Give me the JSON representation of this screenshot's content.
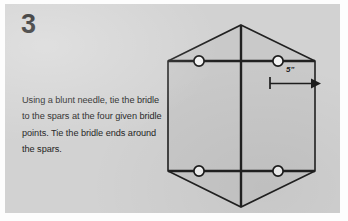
{
  "step": {
    "number": "3",
    "instruction_lines": [
      "Using a blunt needle, tie the bridle",
      "to the spars at the four given bridle",
      "points. Tie the bridle ends around",
      "the spars."
    ]
  },
  "diagram": {
    "shape": "hexagon",
    "dimension": {
      "label": "5\"",
      "marker": "tick-and-arrow",
      "measures": "distance-from-vertical-spar-to-right-edge"
    },
    "bridle_points": [
      {
        "name": "upper-left-bridle-point"
      },
      {
        "name": "upper-right-bridle-point"
      },
      {
        "name": "lower-left-bridle-point"
      },
      {
        "name": "lower-right-bridle-point"
      }
    ],
    "spars": [
      {
        "name": "vertical-spar"
      },
      {
        "name": "upper-horizontal-spar"
      },
      {
        "name": "lower-horizontal-spar"
      }
    ]
  },
  "colors": {
    "panel_background": "#d2d2d2",
    "sail_fill": "#c9c9c9",
    "line": "#212121",
    "bridle_point_fill": "#f2f2f2",
    "text": "#232323"
  }
}
